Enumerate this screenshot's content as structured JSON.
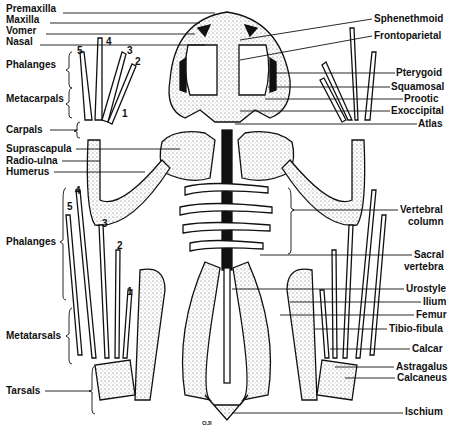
{
  "figure": {
    "signature": "OJI",
    "colors": {
      "ink": "#111111",
      "bone": "#ffffff",
      "stipple": "#8a8a8a",
      "background": "#ffffff"
    }
  },
  "labels_left": [
    {
      "text": "Premaxilla",
      "x": 6,
      "y": 9
    },
    {
      "text": "Maxilla",
      "x": 6,
      "y": 19
    },
    {
      "text": "Vomer",
      "x": 6,
      "y": 30
    },
    {
      "text": "Nasal",
      "x": 6,
      "y": 41
    },
    {
      "text": "Phalanges",
      "x": 6,
      "y": 64
    },
    {
      "text": "Metacarpals",
      "x": 6,
      "y": 98
    },
    {
      "text": "Carpals",
      "x": 6,
      "y": 126
    },
    {
      "text": "Suprascapula",
      "x": 6,
      "y": 145
    },
    {
      "text": "Radio-ulna",
      "x": 6,
      "y": 157
    },
    {
      "text": "Humerus",
      "x": 6,
      "y": 168
    },
    {
      "text": "Phalanges",
      "x": 6,
      "y": 238
    },
    {
      "text": "Metatarsals",
      "x": 6,
      "y": 332
    },
    {
      "text": "Tarsals",
      "x": 6,
      "y": 387
    }
  ],
  "labels_right": [
    {
      "text": "Sphenethmoid",
      "x": 373,
      "y": 15
    },
    {
      "text": "Frontoparietal",
      "x": 374,
      "y": 32
    },
    {
      "text": "Pterygoid",
      "x": 396,
      "y": 69
    },
    {
      "text": "Squamosal",
      "x": 391,
      "y": 83
    },
    {
      "text": "Prootic",
      "x": 404,
      "y": 95
    },
    {
      "text": "Exoccipital",
      "x": 391,
      "y": 107
    },
    {
      "text": "Atlas",
      "x": 418,
      "y": 120
    },
    {
      "text": "Vertebral",
      "x": 400,
      "y": 206
    },
    {
      "text": "column",
      "x": 408,
      "y": 218
    },
    {
      "text": "Sacral",
      "x": 414,
      "y": 251
    },
    {
      "text": "vertebra",
      "x": 404,
      "y": 263
    },
    {
      "text": "Urostyle",
      "x": 406,
      "y": 285
    },
    {
      "text": "Ilium",
      "x": 423,
      "y": 298
    },
    {
      "text": "Femur",
      "x": 416,
      "y": 311
    },
    {
      "text": "Tibio-fibula",
      "x": 389,
      "y": 325
    },
    {
      "text": "Calcar",
      "x": 412,
      "y": 345
    },
    {
      "text": "Astragalus",
      "x": 396,
      "y": 363
    },
    {
      "text": "Calcaneus",
      "x": 397,
      "y": 374
    },
    {
      "text": "Ischium",
      "x": 405,
      "y": 408
    }
  ],
  "digit_numbers_hand": [
    {
      "n": "5",
      "x": 75,
      "y": 50
    },
    {
      "n": "4",
      "x": 105,
      "y": 37
    },
    {
      "n": "3",
      "x": 127,
      "y": 49
    },
    {
      "n": "2",
      "x": 136,
      "y": 61
    },
    {
      "n": "1",
      "x": 122,
      "y": 112
    }
  ],
  "digit_numbers_foot": [
    {
      "n": "4",
      "x": 74,
      "y": 189
    },
    {
      "n": "5",
      "x": 66,
      "y": 206
    },
    {
      "n": "3",
      "x": 102,
      "y": 223
    },
    {
      "n": "2",
      "x": 117,
      "y": 244
    },
    {
      "n": "1",
      "x": 127,
      "y": 290
    }
  ]
}
